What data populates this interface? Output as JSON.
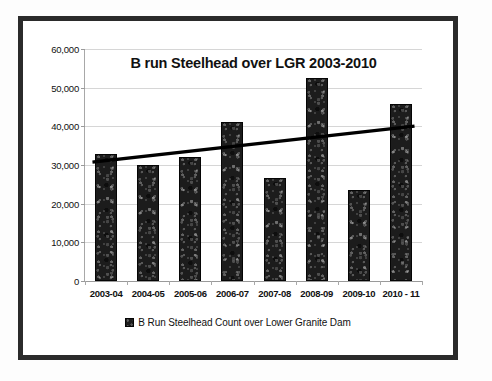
{
  "chart_data": {
    "type": "bar",
    "title": "B run Steelhead over LGR 2003-2010",
    "xlabel": "",
    "ylabel": "",
    "ylim": [
      0,
      60000
    ],
    "ystep": 10000,
    "grid": true,
    "legend_position": "bottom",
    "categories": [
      "2003-04",
      "2004-05",
      "2005-06",
      "2006-07",
      "2007-08",
      "2008-09",
      "2009-10",
      "2010 - 11"
    ],
    "values": [
      32800,
      30000,
      32000,
      41000,
      26700,
      52500,
      23500,
      45800
    ],
    "ytick_labels": [
      "60,000",
      "50,000",
      "40,000",
      "30,000",
      "20,000",
      "10,000",
      "0"
    ],
    "ytick_values": [
      60000,
      50000,
      40000,
      30000,
      20000,
      10000,
      0
    ],
    "series": [
      {
        "name": "B Run Steelhead Count over Lower Granite Dam",
        "type": "bar",
        "color": "#1c1c1c",
        "values": [
          32800,
          30000,
          32000,
          41000,
          26700,
          52500,
          23500,
          45800
        ]
      },
      {
        "name": "Linear trend",
        "type": "line",
        "color": "#000000",
        "start_value": 30800,
        "end_value": 40000
      }
    ],
    "legend": [
      {
        "label": "B Run Steelhead Count over Lower Granite Dam",
        "color": "#1c1c1c"
      }
    ]
  },
  "colors": {
    "frame": "#2b2b2b",
    "bar": "#1c1c1c",
    "gridline": "#d6d6d6",
    "axis": "#9a9a9a",
    "trendline": "#000000",
    "background": "#ffffff",
    "text": "#111111"
  }
}
